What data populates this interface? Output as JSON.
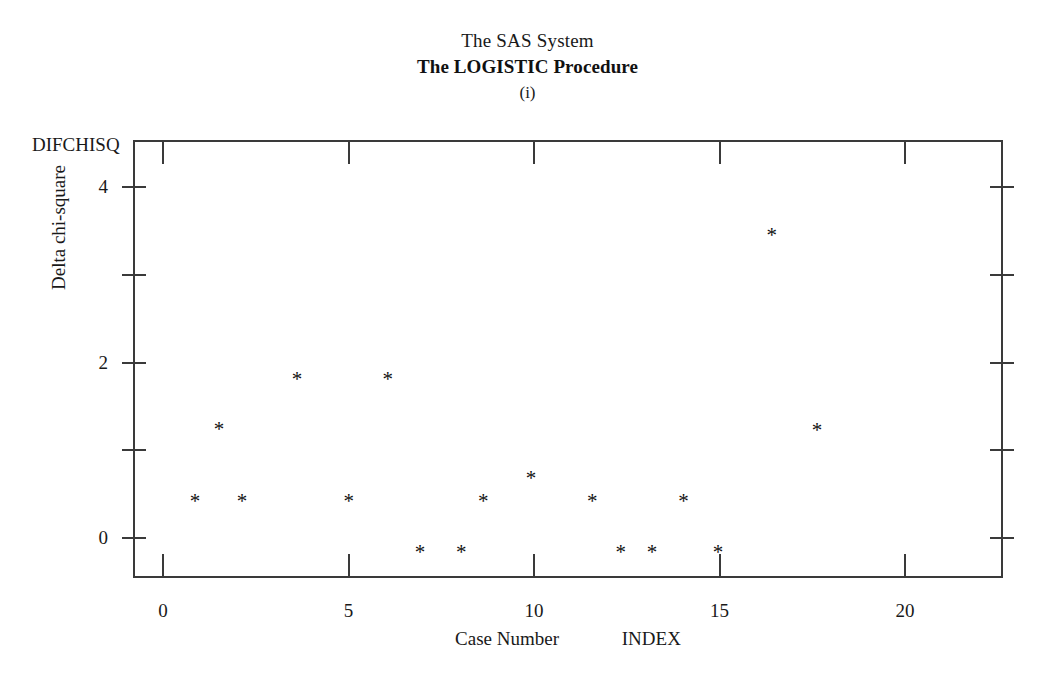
{
  "titles": {
    "line1": "The SAS System",
    "line2": "The LOGISTIC Procedure",
    "line3": "(i)"
  },
  "axes": {
    "y_corner_label": "DIFCHISQ",
    "y_axis_title": "Delta chi-square",
    "x_axis_title": "Case Number",
    "x_axis_variable": "INDEX",
    "x_ticks": [
      "0",
      "5",
      "10",
      "15",
      "20"
    ],
    "y_ticks": [
      "0",
      "2",
      "4"
    ]
  },
  "marker": {
    "glyph": "*",
    "color": "#111111"
  },
  "chart_data": {
    "type": "scatter",
    "xlabel": "Case Number   INDEX",
    "ylabel": "Delta chi-square",
    "ylegend": "DIFCHISQ",
    "xlim": [
      -0.8,
      22.6
    ],
    "ylim": [
      -0.45,
      4.45
    ],
    "xticks": [
      0,
      5,
      10,
      15,
      20
    ],
    "yticks": [
      0,
      2,
      4
    ],
    "yticks_minor": [
      1,
      3
    ],
    "grid": false,
    "legend": null,
    "series": [
      {
        "name": "DIFCHISQ",
        "marker": "*",
        "color": "#111111",
        "points": [
          {
            "x": 0.86,
            "y": 0.46
          },
          {
            "x": 1.51,
            "y": 1.28
          },
          {
            "x": 2.13,
            "y": 0.46
          },
          {
            "x": 3.61,
            "y": 1.85
          },
          {
            "x": 5.01,
            "y": 0.46
          },
          {
            "x": 6.06,
            "y": 1.85
          },
          {
            "x": 6.93,
            "y": -0.13
          },
          {
            "x": 8.04,
            "y": -0.13
          },
          {
            "x": 8.63,
            "y": 0.46
          },
          {
            "x": 9.92,
            "y": 0.72
          },
          {
            "x": 11.57,
            "y": 0.46
          },
          {
            "x": 12.34,
            "y": -0.13
          },
          {
            "x": 13.18,
            "y": -0.13
          },
          {
            "x": 14.03,
            "y": 0.46
          },
          {
            "x": 14.96,
            "y": -0.13
          },
          {
            "x": 16.41,
            "y": 3.49
          },
          {
            "x": 17.63,
            "y": 1.27
          }
        ]
      }
    ]
  }
}
